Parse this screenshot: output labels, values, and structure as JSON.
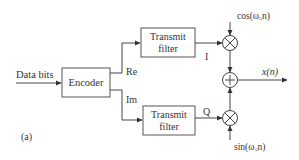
{
  "diagram": {
    "panel_label": "(a)",
    "input_label": "Data bits",
    "encoder_label": "Encoder",
    "branch_re": "Re",
    "branch_im": "Im",
    "filter_top": {
      "line1": "Transmit",
      "line2": "filter"
    },
    "filter_bottom": {
      "line1": "Transmit",
      "line2": "filter"
    },
    "signal_i": "I",
    "signal_q": "Q",
    "carrier_cos": "cos(ω꜀n)",
    "carrier_sin": "sin(ω꜀n)",
    "output_label": "x(n)",
    "multiplier_symbol": "×",
    "adder_symbol": "+",
    "colors": {
      "stroke": "#444444",
      "text": "#333333",
      "background": "#ffffff"
    }
  }
}
